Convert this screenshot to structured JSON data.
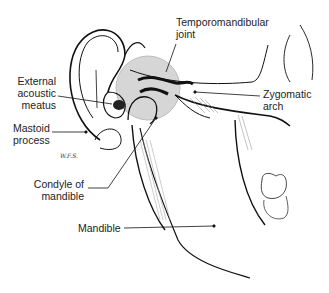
{
  "diagram": {
    "type": "anatomical illustration",
    "labels": {
      "tmj": [
        "Temporomandibular",
        "joint"
      ],
      "external_acoustic_meatus": [
        "External",
        "acoustic",
        "meatus"
      ],
      "zygomatic_arch": [
        "Zygomatic",
        "arch"
      ],
      "mastoid_process": [
        "Mastoid",
        "process"
      ],
      "condyle": [
        "Condyle of",
        "mandible"
      ],
      "mandible": "Mandible"
    },
    "signature": "W.F.S.",
    "colors": {
      "joint_highlight": "#d6d6d6",
      "line": "#111111",
      "background": "#ffffff"
    }
  }
}
